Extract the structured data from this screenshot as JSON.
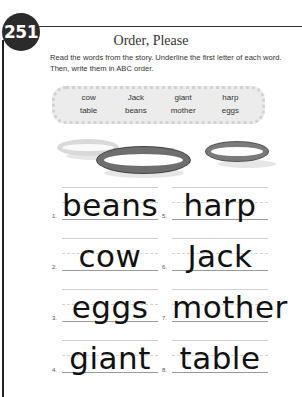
{
  "page": {
    "number": "251",
    "title": "Order, Please",
    "instructions": "Read the words from the story. Underline the first letter of each word. Then, write them in ABC order."
  },
  "word_box": {
    "words": [
      "cow",
      "Jack",
      "giant",
      "harp",
      "table",
      "beans",
      "mother",
      "eggs"
    ]
  },
  "answers": [
    {
      "num": "1.",
      "word": "beans"
    },
    {
      "num": "2.",
      "word": "cow"
    },
    {
      "num": "3.",
      "word": "eggs"
    },
    {
      "num": "4.",
      "word": "giant"
    },
    {
      "num": "5.",
      "word": "harp"
    },
    {
      "num": "6.",
      "word": "Jack"
    },
    {
      "num": "7.",
      "word": "mother"
    },
    {
      "num": "8.",
      "word": "table"
    }
  ],
  "colors": {
    "badge": "#2b2b2b",
    "word_box_bg": "#ececec",
    "plate_light": "#d8d8d8",
    "plate_dark": "#6e6e6e"
  }
}
